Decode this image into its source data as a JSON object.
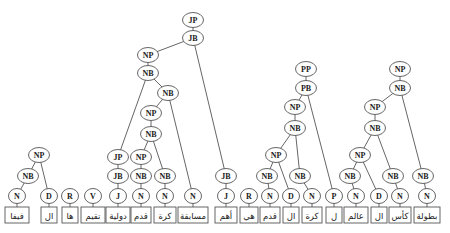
{
  "diagram": {
    "type": "parse-tree",
    "tokens": [
      {
        "id": "t0",
        "word": "فيفا",
        "x": 17,
        "w": 24
      },
      {
        "id": "t1",
        "word": "ال",
        "x": 49,
        "w": 16
      },
      {
        "id": "t2",
        "word": "ها",
        "x": 70,
        "w": 16
      },
      {
        "id": "t3",
        "word": "تقيم",
        "x": 93,
        "w": 24
      },
      {
        "id": "t4",
        "word": "دولية",
        "x": 118,
        "w": 24
      },
      {
        "id": "t5",
        "word": "قدم",
        "x": 141,
        "w": 20
      },
      {
        "id": "t6",
        "word": "كرة",
        "x": 165,
        "w": 22
      },
      {
        "id": "t7",
        "word": "مسابقة",
        "x": 193,
        "w": 30
      },
      {
        "id": "t8",
        "word": "أهم",
        "x": 226,
        "w": 22
      },
      {
        "id": "t9",
        "word": "هي",
        "x": 249,
        "w": 18
      },
      {
        "id": "t10",
        "word": "قدم",
        "x": 270,
        "w": 20
      },
      {
        "id": "t11",
        "word": "ال",
        "x": 291,
        "w": 16
      },
      {
        "id": "t12",
        "word": "كرة",
        "x": 312,
        "w": 20
      },
      {
        "id": "t13",
        "word": "ل",
        "x": 334,
        "w": 16
      },
      {
        "id": "t14",
        "word": "عالم",
        "x": 356,
        "w": 24
      },
      {
        "id": "t15",
        "word": "ال",
        "x": 379,
        "w": 16
      },
      {
        "id": "t16",
        "word": "كأس",
        "x": 400,
        "w": 22
      },
      {
        "id": "t17",
        "word": "بطولة",
        "x": 427,
        "w": 26
      }
    ],
    "nodes": [
      {
        "id": "p0",
        "label": "N",
        "x": 17,
        "y": 196
      },
      {
        "id": "p1",
        "label": "D",
        "x": 49,
        "y": 196
      },
      {
        "id": "p2",
        "label": "R",
        "x": 70,
        "y": 196
      },
      {
        "id": "p3",
        "label": "V",
        "x": 93,
        "y": 196
      },
      {
        "id": "p4",
        "label": "J",
        "x": 118,
        "y": 196
      },
      {
        "id": "p5",
        "label": "N",
        "x": 141,
        "y": 196
      },
      {
        "id": "p6",
        "label": "N",
        "x": 165,
        "y": 196
      },
      {
        "id": "p7",
        "label": "N",
        "x": 193,
        "y": 196
      },
      {
        "id": "p8",
        "label": "J",
        "x": 226,
        "y": 196
      },
      {
        "id": "p9",
        "label": "R",
        "x": 249,
        "y": 196
      },
      {
        "id": "p10",
        "label": "N",
        "x": 270,
        "y": 196
      },
      {
        "id": "p11",
        "label": "D",
        "x": 291,
        "y": 196
      },
      {
        "id": "p12",
        "label": "N",
        "x": 312,
        "y": 196
      },
      {
        "id": "p13",
        "label": "P",
        "x": 334,
        "y": 196
      },
      {
        "id": "p14",
        "label": "N",
        "x": 356,
        "y": 196
      },
      {
        "id": "p15",
        "label": "D",
        "x": 379,
        "y": 196
      },
      {
        "id": "p16",
        "label": "N",
        "x": 400,
        "y": 196
      },
      {
        "id": "p17",
        "label": "N",
        "x": 427,
        "y": 196
      },
      {
        "id": "a_nb",
        "label": "NB",
        "x": 28,
        "y": 176
      },
      {
        "id": "a_np",
        "label": "NP",
        "x": 39,
        "y": 155
      },
      {
        "id": "b_jb",
        "label": "JB",
        "x": 118,
        "y": 176
      },
      {
        "id": "b_jp",
        "label": "JP",
        "x": 118,
        "y": 157
      },
      {
        "id": "b_nb1",
        "label": "NB",
        "x": 141,
        "y": 176
      },
      {
        "id": "b_nb2",
        "label": "NB",
        "x": 165,
        "y": 176
      },
      {
        "id": "b_np1",
        "label": "NP",
        "x": 141,
        "y": 157
      },
      {
        "id": "b_nb3",
        "label": "NB",
        "x": 151,
        "y": 134
      },
      {
        "id": "b_np2",
        "label": "NP",
        "x": 151,
        "y": 113
      },
      {
        "id": "b_nb4",
        "label": "NB",
        "x": 168,
        "y": 93
      },
      {
        "id": "b_nb5",
        "label": "NB",
        "x": 148,
        "y": 73
      },
      {
        "id": "b_np3",
        "label": "NP",
        "x": 148,
        "y": 55
      },
      {
        "id": "c_jb",
        "label": "JB",
        "x": 226,
        "y": 176
      },
      {
        "id": "b_jb2",
        "label": "JB",
        "x": 193,
        "y": 38
      },
      {
        "id": "b_jp2",
        "label": "JP",
        "x": 193,
        "y": 20
      },
      {
        "id": "d_nb1",
        "label": "NB",
        "x": 267,
        "y": 176
      },
      {
        "id": "d_np1",
        "label": "NP",
        "x": 276,
        "y": 155
      },
      {
        "id": "d_nb2",
        "label": "NB",
        "x": 300,
        "y": 176
      },
      {
        "id": "d_nb3",
        "label": "NB",
        "x": 295,
        "y": 128
      },
      {
        "id": "d_np2",
        "label": "NP",
        "x": 295,
        "y": 107
      },
      {
        "id": "d_pb",
        "label": "PB",
        "x": 306,
        "y": 88
      },
      {
        "id": "d_pp",
        "label": "PP",
        "x": 306,
        "y": 69
      },
      {
        "id": "e_nb1",
        "label": "NB",
        "x": 350,
        "y": 176
      },
      {
        "id": "e_np1",
        "label": "NP",
        "x": 360,
        "y": 155
      },
      {
        "id": "e_nb2",
        "label": "NB",
        "x": 393,
        "y": 176
      },
      {
        "id": "e_nb3",
        "label": "NB",
        "x": 375,
        "y": 128
      },
      {
        "id": "e_np2",
        "label": "NP",
        "x": 375,
        "y": 107
      },
      {
        "id": "e_nb4",
        "label": "NB",
        "x": 400,
        "y": 88
      },
      {
        "id": "e_np3",
        "label": "NP",
        "x": 400,
        "y": 69
      },
      {
        "id": "e_nb5",
        "label": "NB",
        "x": 423,
        "y": 176
      }
    ],
    "edges": [
      [
        "p0",
        "t0"
      ],
      [
        "p1",
        "t1"
      ],
      [
        "p2",
        "t2"
      ],
      [
        "p3",
        "t3"
      ],
      [
        "p4",
        "t4"
      ],
      [
        "p5",
        "t5"
      ],
      [
        "p6",
        "t6"
      ],
      [
        "p7",
        "t7"
      ],
      [
        "p8",
        "t8"
      ],
      [
        "p9",
        "t9"
      ],
      [
        "p10",
        "t10"
      ],
      [
        "p11",
        "t11"
      ],
      [
        "p12",
        "t12"
      ],
      [
        "p13",
        "t13"
      ],
      [
        "p14",
        "t14"
      ],
      [
        "p15",
        "t15"
      ],
      [
        "p16",
        "t16"
      ],
      [
        "p17",
        "t17"
      ],
      [
        "a_np",
        "a_nb"
      ],
      [
        "a_nb",
        "p0"
      ],
      [
        "a_np",
        "p1"
      ],
      [
        "b_jp",
        "b_jb"
      ],
      [
        "b_jb",
        "p4"
      ],
      [
        "b_nb1",
        "p5"
      ],
      [
        "b_nb2",
        "p6"
      ],
      [
        "b_np1",
        "b_nb1"
      ],
      [
        "b_nb3",
        "b_np1"
      ],
      [
        "b_nb3",
        "b_nb2"
      ],
      [
        "b_np2",
        "b_nb3"
      ],
      [
        "b_nb4",
        "b_np2"
      ],
      [
        "b_nb4",
        "p7"
      ],
      [
        "b_nb5",
        "b_jp"
      ],
      [
        "b_nb5",
        "b_nb4"
      ],
      [
        "b_np3",
        "b_nb5"
      ],
      [
        "b_jb2",
        "b_np3"
      ],
      [
        "b_jb2",
        "c_jb"
      ],
      [
        "c_jb",
        "p8"
      ],
      [
        "b_jp2",
        "b_jb2"
      ],
      [
        "d_nb1",
        "p10"
      ],
      [
        "d_np1",
        "d_nb1"
      ],
      [
        "d_np1",
        "p11"
      ],
      [
        "d_nb2",
        "p12"
      ],
      [
        "d_nb3",
        "d_np1"
      ],
      [
        "d_nb3",
        "d_nb2"
      ],
      [
        "d_np2",
        "d_nb3"
      ],
      [
        "d_pb",
        "d_np2"
      ],
      [
        "d_pb",
        "p13"
      ],
      [
        "d_pp",
        "d_pb"
      ],
      [
        "e_nb1",
        "p14"
      ],
      [
        "e_np1",
        "e_nb1"
      ],
      [
        "e_np1",
        "p15"
      ],
      [
        "e_nb2",
        "p16"
      ],
      [
        "e_nb3",
        "e_np1"
      ],
      [
        "e_nb3",
        "e_nb2"
      ],
      [
        "e_np2",
        "e_nb3"
      ],
      [
        "e_nb4",
        "e_np2"
      ],
      [
        "e_nb4",
        "e_nb5"
      ],
      [
        "e_nb5",
        "p17"
      ],
      [
        "e_np3",
        "e_nb4"
      ]
    ],
    "colors": {
      "line": "#555555",
      "node_fill": "#ffffff",
      "text": "#222222"
    }
  }
}
